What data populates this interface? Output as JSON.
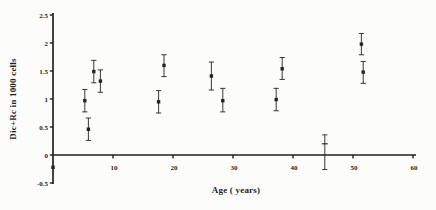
{
  "figure": {
    "background": "#fcfcfb",
    "ink": "#222222"
  },
  "chart_data": {
    "type": "scatter",
    "title": "",
    "xlabel": "Age ( years)",
    "ylabel": "Dic+Rc in 1000 cells",
    "xlim": [
      0,
      60
    ],
    "ylim": [
      -0.5,
      2.5
    ],
    "grid": false,
    "legend": null,
    "x_ticks": [
      {
        "v": 10,
        "label": "10"
      },
      {
        "v": 20,
        "label": "20"
      },
      {
        "v": 30,
        "label": "30"
      },
      {
        "v": 40,
        "label": "40"
      },
      {
        "v": 50,
        "label": "50"
      },
      {
        "v": 60,
        "label": "60"
      }
    ],
    "y_ticks": [
      {
        "v": -0.5,
        "label": "-0.5"
      },
      {
        "v": 0,
        "label": "0"
      },
      {
        "v": 0.5,
        "label": "0.5"
      },
      {
        "v": 1,
        "label": "1"
      },
      {
        "v": 1.5,
        "label": "1.5"
      },
      {
        "v": 2,
        "label": "2"
      },
      {
        "v": 2.5,
        "label": "2.5"
      }
    ],
    "series": [
      {
        "name": "Dic+Rc frequency per 1000 cells vs age (mean with error bars)",
        "marker": "square",
        "points": [
          {
            "x": 0.0,
            "y": -0.22,
            "lo": null,
            "hi": null
          },
          {
            "x": 5.3,
            "y": 0.97,
            "lo": 0.77,
            "hi": 1.17
          },
          {
            "x": 5.9,
            "y": 0.46,
            "lo": 0.26,
            "hi": 0.66
          },
          {
            "x": 6.8,
            "y": 1.49,
            "lo": 1.29,
            "hi": 1.69
          },
          {
            "x": 7.9,
            "y": 1.32,
            "lo": 1.12,
            "hi": 1.52
          },
          {
            "x": 17.6,
            "y": 0.95,
            "lo": 0.75,
            "hi": 1.15
          },
          {
            "x": 18.5,
            "y": 1.6,
            "lo": 1.4,
            "hi": 1.79
          },
          {
            "x": 26.4,
            "y": 1.41,
            "lo": 1.16,
            "hi": 1.66
          },
          {
            "x": 28.3,
            "y": 0.97,
            "lo": 0.77,
            "hi": 1.19
          },
          {
            "x": 37.2,
            "y": 0.99,
            "lo": 0.79,
            "hi": 1.19
          },
          {
            "x": 38.2,
            "y": 1.54,
            "lo": 1.35,
            "hi": 1.74
          },
          {
            "x": 45.3,
            "y": 0.2,
            "lo": -0.26,
            "hi": 0.36,
            "marker": "plus"
          },
          {
            "x": 51.4,
            "y": 1.98,
            "lo": 1.79,
            "hi": 2.17
          },
          {
            "x": 51.7,
            "y": 1.48,
            "lo": 1.28,
            "hi": 1.67
          }
        ]
      }
    ]
  }
}
